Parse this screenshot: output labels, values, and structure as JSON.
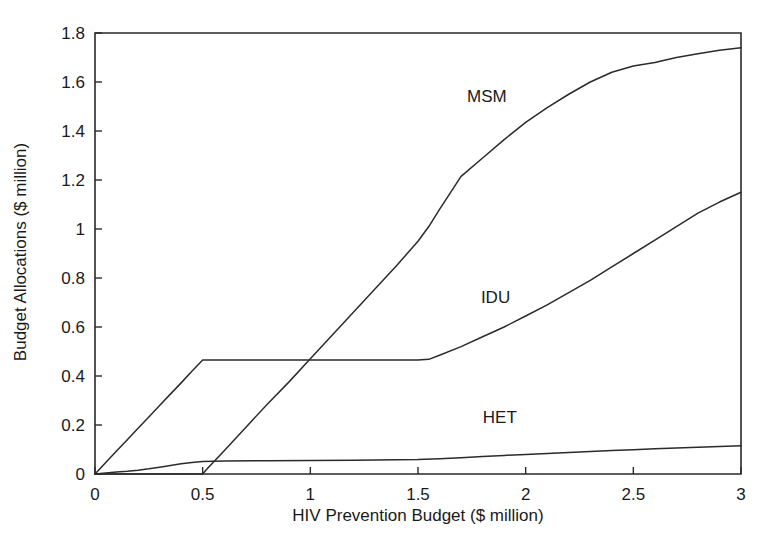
{
  "chart_data": {
    "type": "line",
    "title": "",
    "subtitle": "",
    "xlabel": "HIV Prevention Budget ($ million)",
    "ylabel": "Budget Allocations ($ million)",
    "xlim": [
      0,
      3
    ],
    "ylim": [
      0,
      1.8
    ],
    "xticks": [
      "0",
      "0.5",
      "1",
      "1.5",
      "2",
      "2.5",
      "3"
    ],
    "xtick_values": [
      0,
      0.5,
      1,
      1.5,
      2,
      2.5,
      3
    ],
    "yticks": [
      "0",
      "0.2",
      "0.4",
      "0.6",
      "0.8",
      "1",
      "1.2",
      "1.4",
      "1.6",
      "1.8"
    ],
    "ytick_values": [
      0,
      0.2,
      0.4,
      0.6,
      0.8,
      1.0,
      1.2,
      1.4,
      1.6,
      1.8
    ],
    "grid": false,
    "legend_position": "inline-annotations",
    "annotations": [
      {
        "text": "MSM",
        "x": 1.82,
        "y": 1.52
      },
      {
        "text": "IDU",
        "x": 1.86,
        "y": 0.7
      },
      {
        "text": "HET",
        "x": 1.88,
        "y": 0.21
      }
    ],
    "series": [
      {
        "name": "MSM",
        "x": [
          0.0,
          0.5,
          0.52,
          0.6,
          0.7,
          0.8,
          0.9,
          1.0,
          1.1,
          1.2,
          1.3,
          1.4,
          1.5,
          1.55,
          1.6,
          1.7,
          1.8,
          1.9,
          2.0,
          2.1,
          2.2,
          2.3,
          2.4,
          2.5,
          2.6,
          2.7,
          2.8,
          2.9,
          3.0
        ],
        "y": [
          0.0,
          0.0,
          0.02,
          0.095,
          0.19,
          0.285,
          0.375,
          0.47,
          0.565,
          0.66,
          0.755,
          0.85,
          0.95,
          1.01,
          1.08,
          1.215,
          1.29,
          1.365,
          1.435,
          1.495,
          1.55,
          1.6,
          1.64,
          1.665,
          1.68,
          1.7,
          1.715,
          1.73,
          1.74
        ]
      },
      {
        "name": "IDU",
        "x": [
          0.0,
          0.05,
          0.1,
          0.15,
          0.2,
          0.25,
          0.3,
          0.35,
          0.4,
          0.45,
          0.5,
          0.7,
          0.9,
          1.1,
          1.3,
          1.5,
          1.55,
          1.6,
          1.7,
          1.8,
          1.9,
          2.0,
          2.1,
          2.2,
          2.3,
          2.4,
          2.5,
          2.6,
          2.7,
          2.8,
          2.9,
          3.0
        ],
        "y": [
          0.0,
          0.047,
          0.094,
          0.14,
          0.187,
          0.233,
          0.28,
          0.326,
          0.372,
          0.419,
          0.465,
          0.465,
          0.465,
          0.465,
          0.465,
          0.465,
          0.468,
          0.485,
          0.52,
          0.56,
          0.6,
          0.645,
          0.69,
          0.74,
          0.79,
          0.845,
          0.9,
          0.955,
          1.01,
          1.065,
          1.11,
          1.15
        ]
      },
      {
        "name": "HET",
        "x": [
          0.0,
          0.05,
          0.1,
          0.15,
          0.2,
          0.25,
          0.3,
          0.35,
          0.4,
          0.45,
          0.5,
          0.6,
          0.8,
          1.0,
          1.2,
          1.3,
          1.4,
          1.5,
          1.6,
          1.7,
          1.8,
          1.9,
          2.0,
          2.1,
          2.2,
          2.3,
          2.4,
          2.5,
          2.6,
          2.7,
          2.8,
          2.9,
          3.0
        ],
        "y": [
          0.0,
          0.004,
          0.008,
          0.011,
          0.015,
          0.021,
          0.028,
          0.035,
          0.042,
          0.047,
          0.051,
          0.053,
          0.054,
          0.055,
          0.056,
          0.057,
          0.058,
          0.059,
          0.062,
          0.066,
          0.071,
          0.076,
          0.08,
          0.084,
          0.088,
          0.092,
          0.096,
          0.099,
          0.103,
          0.106,
          0.109,
          0.112,
          0.115
        ]
      }
    ]
  },
  "colors": {
    "line": "#2b2b2b",
    "axis": "#2a2a2a",
    "text": "#1a1a1a",
    "background": "#ffffff"
  }
}
